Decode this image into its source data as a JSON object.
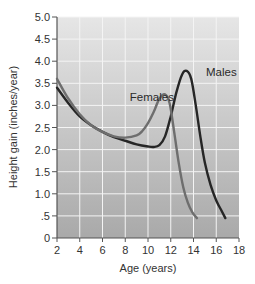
{
  "chart_data": {
    "type": "line",
    "title": "",
    "xlabel": "Age (years)",
    "ylabel": "Height gain (inches/year)",
    "xlim": [
      2,
      18
    ],
    "ylim": [
      0,
      5.0
    ],
    "x_ticks": [
      2,
      4,
      6,
      8,
      10,
      12,
      14,
      16,
      18
    ],
    "x_tick_labels": [
      "2",
      "4",
      "6",
      "8",
      "10",
      "12",
      "14",
      "16",
      "18"
    ],
    "y_ticks": [
      0,
      0.5,
      1.0,
      1.5,
      2.0,
      2.5,
      3.0,
      3.5,
      4.0,
      4.5,
      5.0
    ],
    "y_tick_labels": [
      "0",
      ".5",
      "1.0",
      "1.5",
      "2.0",
      "2.5",
      "3.0",
      "3.5",
      "4.0",
      "4.5",
      "5.0"
    ],
    "grid": true,
    "legend": "inline labels",
    "series": [
      {
        "name": "Males",
        "color": "#262626",
        "x": [
          2,
          3,
          4,
          5,
          6,
          7,
          8,
          9,
          10,
          10.5,
          11,
          11.5,
          12,
          12.5,
          13,
          13.4,
          13.8,
          14.2,
          14.6,
          15,
          15.5,
          16,
          16.5,
          16.8
        ],
        "values": [
          3.4,
          3.05,
          2.75,
          2.55,
          2.4,
          2.28,
          2.2,
          2.12,
          2.07,
          2.06,
          2.1,
          2.3,
          2.75,
          3.3,
          3.7,
          3.78,
          3.6,
          3.0,
          2.3,
          1.7,
          1.2,
          0.85,
          0.6,
          0.45
        ]
      },
      {
        "name": "Females",
        "color": "#6e6e6e",
        "x": [
          2,
          3,
          4,
          5,
          6,
          7,
          8,
          9,
          9.5,
          10,
          10.5,
          11,
          11.5,
          11.9,
          12.3,
          12.7,
          13.1,
          13.5,
          13.9,
          14.3
        ],
        "values": [
          3.6,
          3.15,
          2.8,
          2.55,
          2.4,
          2.3,
          2.27,
          2.32,
          2.42,
          2.6,
          2.85,
          3.15,
          3.25,
          3.05,
          2.4,
          1.7,
          1.15,
          0.8,
          0.58,
          0.45
        ]
      }
    ],
    "annotations": [
      {
        "text": "Males",
        "x": 15.1,
        "y": 3.75
      },
      {
        "text": "Females",
        "x": 8.4,
        "y": 3.2
      }
    ]
  },
  "style": {
    "plot_bg_top": "#e6e6e6",
    "plot_bg_bottom": "#a9a9a9",
    "grid_color": "#f4f4f4",
    "axis_color": "#555555"
  }
}
